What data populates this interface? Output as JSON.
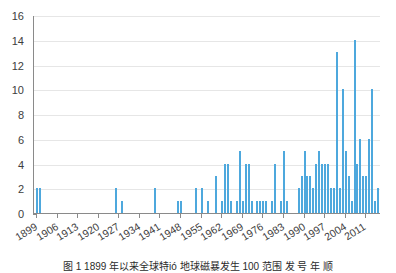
{
  "chart_data": {
    "type": "bar",
    "title": "",
    "subtitle": "",
    "xlabel": "",
    "ylabel": "",
    "xlim": [
      1898,
      2016
    ],
    "ylim": [
      0,
      16
    ],
    "grid": "horizontal",
    "legend": "none",
    "bar_color": "#4ea8dd",
    "axis_color": "#8a8a8a",
    "grid_color": "#e6e6e6",
    "ytick_labels": [
      "0",
      "2",
      "4",
      "6",
      "8",
      "10",
      "12",
      "14",
      "16"
    ],
    "ytick_values": [
      0,
      2,
      4,
      6,
      8,
      10,
      12,
      14,
      16
    ],
    "xtick_labels": [
      "1899",
      "1906",
      "1913",
      "1920",
      "1927",
      "1934",
      "1941",
      "1948",
      "1955",
      "1962",
      "1969",
      "1976",
      "1983",
      "1990",
      "1997",
      "2004",
      "2011"
    ],
    "xtick_values": [
      1899,
      1906,
      1913,
      1920,
      1927,
      1934,
      1941,
      1948,
      1955,
      1962,
      1969,
      1976,
      1983,
      1990,
      1997,
      2004,
      2011
    ],
    "categories": [
      1899,
      1900,
      1901,
      1902,
      1903,
      1904,
      1905,
      1906,
      1907,
      1908,
      1909,
      1910,
      1911,
      1912,
      1913,
      1914,
      1915,
      1916,
      1917,
      1918,
      1919,
      1920,
      1921,
      1922,
      1923,
      1924,
      1925,
      1926,
      1927,
      1928,
      1929,
      1930,
      1931,
      1932,
      1933,
      1934,
      1935,
      1936,
      1937,
      1938,
      1939,
      1940,
      1941,
      1942,
      1943,
      1944,
      1945,
      1946,
      1947,
      1948,
      1949,
      1950,
      1951,
      1952,
      1953,
      1954,
      1955,
      1956,
      1957,
      1958,
      1959,
      1960,
      1961,
      1962,
      1963,
      1964,
      1965,
      1966,
      1967,
      1968,
      1969,
      1970,
      1971,
      1972,
      1973,
      1974,
      1975,
      1976,
      1977,
      1978,
      1979,
      1980,
      1981,
      1982,
      1983,
      1984,
      1985,
      1986,
      1987,
      1988,
      1989,
      1990,
      1991,
      1992,
      1993,
      1994,
      1995,
      1996,
      1997,
      1998,
      1999,
      2000,
      2001,
      2002,
      2003,
      2004,
      2005,
      2006,
      2007,
      2008,
      2009,
      2010,
      2011,
      2012,
      2013,
      2014,
      2015
    ],
    "values": [
      2,
      2,
      0,
      0,
      0,
      0,
      0,
      0,
      0,
      0,
      0,
      0,
      0,
      0,
      0,
      0,
      0,
      0,
      0,
      0,
      0,
      0,
      0,
      0,
      0,
      0,
      0,
      2,
      0,
      1,
      0,
      0,
      0,
      0,
      0,
      0,
      0,
      0,
      0,
      0,
      2,
      0,
      0,
      0,
      0,
      0,
      0,
      0,
      1,
      1,
      0,
      0,
      0,
      0,
      2,
      0,
      2,
      0,
      1,
      0,
      0,
      3,
      0,
      1,
      4,
      4,
      1,
      0,
      1,
      5,
      1,
      4,
      4,
      1,
      0,
      1,
      1,
      1,
      1,
      0,
      1,
      4,
      0,
      1,
      5,
      1,
      0,
      0,
      0,
      2,
      3,
      5,
      3,
      3,
      2,
      4,
      5,
      4,
      4,
      4,
      2,
      2,
      13,
      2,
      10,
      5,
      3,
      1,
      14,
      4,
      6,
      3,
      3,
      6,
      10,
      1,
      2
    ]
  },
  "caption": {
    "text": "图 1   1899 年以来全球特ió 地球磁暴发生 100 范围  发 号 年 顺"
  },
  "icons": {
    "chart_type": "bar-chart-icon"
  }
}
